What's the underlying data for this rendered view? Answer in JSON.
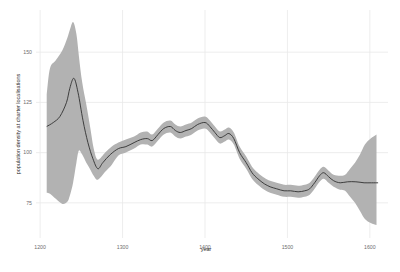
{
  "chart_data": {
    "type": "line",
    "title": "",
    "xlabel": "year",
    "ylabel": "population density at charter localisations",
    "x_ticks": [
      1200,
      1300,
      1400,
      1500,
      1600
    ],
    "y_ticks": [
      75,
      100,
      125,
      150
    ],
    "xlim": [
      1195,
      1622
    ],
    "ylim": [
      57.5,
      171
    ],
    "grid": true,
    "legend": false,
    "colors": {
      "background": "#ffffff",
      "band": "#b2b2b2",
      "line": "#303030",
      "grid": "#e8e8e8",
      "tick_text": "#6e6e6e",
      "axis_title_text": "#2b2b2b"
    },
    "series": [
      {
        "name": "smoothed population density",
        "type": "line",
        "x": [
          1208,
          1216,
          1224,
          1232,
          1236,
          1241,
          1246,
          1252,
          1258,
          1264,
          1270,
          1276,
          1285,
          1295,
          1304,
          1314,
          1322,
          1330,
          1336,
          1343,
          1350,
          1358,
          1364,
          1370,
          1377,
          1384,
          1391,
          1400,
          1406,
          1412,
          1418,
          1424,
          1429,
          1435,
          1442,
          1450,
          1457,
          1464,
          1472,
          1479,
          1487,
          1496,
          1504,
          1513,
          1521,
          1527,
          1533,
          1539,
          1544,
          1550,
          1556,
          1564,
          1573,
          1583,
          1593,
          1602,
          1610
        ],
        "y": [
          113,
          115,
          118,
          125,
          132,
          137,
          130,
          116,
          105,
          97,
          92,
          95,
          99,
          102,
          103,
          105,
          106.5,
          107,
          106,
          109,
          112,
          113,
          111,
          110,
          111,
          112,
          114,
          115,
          113,
          110,
          107.5,
          108.5,
          109.5,
          107,
          100,
          95,
          90,
          87,
          84.5,
          83,
          82,
          81,
          81,
          80.5,
          81,
          82,
          85,
          88.5,
          90,
          88,
          86,
          85,
          85.5,
          85.5,
          85,
          85,
          85
        ]
      },
      {
        "name": "confidence band",
        "type": "band",
        "x": [
          1208,
          1212,
          1219,
          1227,
          1233,
          1236,
          1240,
          1244,
          1247,
          1251,
          1256,
          1261,
          1265,
          1270,
          1279,
          1287,
          1295,
          1304,
          1314,
          1322,
          1330,
          1336,
          1343,
          1350,
          1358,
          1364,
          1370,
          1377,
          1384,
          1391,
          1400,
          1406,
          1412,
          1418,
          1424,
          1429,
          1435,
          1442,
          1450,
          1457,
          1464,
          1472,
          1479,
          1487,
          1496,
          1504,
          1513,
          1521,
          1527,
          1533,
          1539,
          1544,
          1550,
          1556,
          1564,
          1570,
          1576,
          1582,
          1588,
          1594,
          1601,
          1608
        ],
        "upper": [
          129,
          142,
          146,
          151,
          157,
          161,
          165,
          159,
          148,
          135,
          124,
          112,
          102,
          96.5,
          100,
          103,
          105,
          106.5,
          108,
          110,
          110.5,
          109,
          112,
          115,
          116,
          114,
          113,
          114,
          115,
          117,
          118,
          116,
          113,
          110.5,
          111.5,
          112.5,
          110,
          103,
          98,
          93,
          90,
          87.5,
          86,
          85,
          84,
          84,
          83.5,
          84,
          85,
          88,
          91.5,
          93,
          91,
          89,
          88.5,
          89,
          92,
          95,
          99,
          104,
          107,
          109
        ],
        "lower": [
          80,
          79.5,
          77,
          74.5,
          75.5,
          78.5,
          85,
          95,
          101,
          99,
          95,
          91.5,
          88.5,
          86.5,
          90.5,
          94,
          98.5,
          100,
          102,
          104,
          104,
          103,
          106,
          109,
          110,
          108,
          107,
          108,
          109,
          111,
          112,
          110,
          107,
          104.5,
          105.5,
          106.5,
          104,
          97,
          92,
          87,
          84,
          81.5,
          80,
          79,
          78,
          78,
          77.5,
          78,
          79,
          82,
          85.5,
          87,
          85,
          83,
          81.5,
          81,
          78,
          75,
          71,
          67,
          65,
          64
        ]
      }
    ],
    "panel": {
      "left": 36,
      "top": 10,
      "width": 352,
      "height": 228
    }
  }
}
